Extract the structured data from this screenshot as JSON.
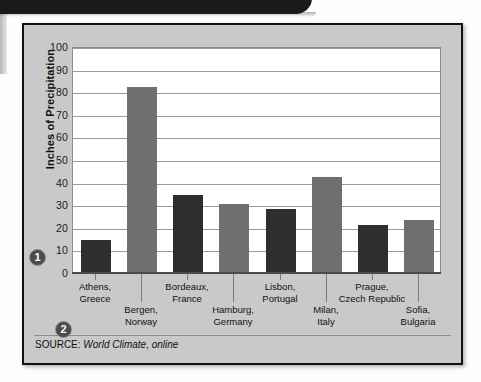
{
  "banner": {
    "present": true,
    "color": "#1a1a1a"
  },
  "markers": [
    {
      "name": "callout-1",
      "label": "1"
    },
    {
      "name": "callout-2",
      "label": "2"
    }
  ],
  "source": {
    "label": "SOURCE:",
    "name": "World Climate, online"
  },
  "colors": {
    "bar_dark": "#2e2e2e",
    "bar_gray": "#6f6f6f",
    "panel": "#c9c9c9",
    "plot_bg": "#ffffff",
    "gridline": "#9a9a9a"
  },
  "chart_data": {
    "type": "bar",
    "title": "",
    "xlabel": "",
    "ylabel": "Inches of Precipitation",
    "ylim": [
      0,
      100
    ],
    "ytick_step": 10,
    "yticks": [
      "100",
      "90",
      "80",
      "70",
      "60",
      "50",
      "40",
      "30",
      "20",
      "10",
      "0"
    ],
    "grid": true,
    "legend": "none",
    "categories": [
      "Athens,\nGreece",
      "Bergen,\nNorway",
      "Bordeaux,\nFrance",
      "Hamburg,\nGermany",
      "Lisbon,\nPortugal",
      "Milan,\nItaly",
      "Prague,\nCzech Republic",
      "Sofia,\nBulgaria"
    ],
    "category_lines": [
      [
        "Athens,",
        "Greece"
      ],
      [
        "Bergen,",
        "Norway"
      ],
      [
        "Bordeaux,",
        "France"
      ],
      [
        "Hamburg,",
        "Germany"
      ],
      [
        "Lisbon,",
        "Portugal"
      ],
      [
        "Milan,",
        "Italy"
      ],
      [
        "Prague,",
        "Czech Republic"
      ],
      [
        "Sofia,",
        "Bulgaria"
      ]
    ],
    "values": [
      14,
      82,
      34,
      30,
      28,
      42,
      21,
      23
    ],
    "bar_colors": [
      "dark",
      "gray",
      "dark",
      "gray",
      "dark",
      "gray",
      "dark",
      "gray"
    ],
    "source": "SOURCE: World Climate, online"
  }
}
